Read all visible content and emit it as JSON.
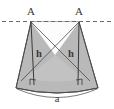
{
  "figure": {
    "background_color": "#ffffff",
    "fill_color": "#b9b9b9",
    "fill_color_light": "#c9c9c9",
    "stroke_color": "#4a4a4a",
    "dashed_line_color": "#6a6a6a",
    "label_color": "#3a3a3a",
    "labels": {
      "apex_left": "A",
      "apex_right": "A",
      "height_left": "h",
      "height_right": "h",
      "base_arc": "a"
    },
    "geometry": {
      "dashed_line_y": 21,
      "apex_left_x": 31,
      "apex_right_x": 79,
      "base_left_x": 16,
      "base_right_x": 98,
      "base_y": 88,
      "arc_dip_y": 97,
      "foot_left_x": 34,
      "foot_right_x": 78,
      "cross_center_x": 55,
      "cross_center_y": 55
    }
  }
}
